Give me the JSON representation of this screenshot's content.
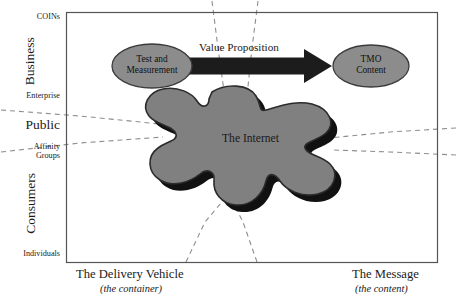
{
  "figure": {
    "type": "conceptual-diagram",
    "background_color": "#ffffff"
  },
  "axes": {
    "y_axis": {
      "name": "delivery-vehicle-axis",
      "labels_top_to_bottom": [
        {
          "text": "COINs",
          "size": "small",
          "orientation": "horizontal"
        },
        {
          "text": "Business",
          "size": "large",
          "orientation": "vertical"
        },
        {
          "text": "Enterprise",
          "size": "small",
          "orientation": "horizontal"
        },
        {
          "text": "Public",
          "size": "large",
          "orientation": "horizontal"
        },
        {
          "text": "Affinity",
          "size": "small",
          "orientation": "horizontal"
        },
        {
          "text": "Groups",
          "size": "small",
          "orientation": "horizontal"
        },
        {
          "text": "Consumers",
          "size": "large",
          "orientation": "vertical"
        },
        {
          "text": "Individuals",
          "size": "small",
          "orientation": "horizontal"
        }
      ]
    },
    "bottom_left": {
      "title": "The Delivery Vehicle",
      "subtitle": "(the container)"
    },
    "bottom_right": {
      "title": "The Message",
      "subtitle": "(the content)"
    }
  },
  "nodes": {
    "source_ellipse": {
      "line1": "Test and",
      "line2": "Measurement",
      "fill": "#8c8c8c",
      "stroke": "#3b3b3b"
    },
    "target_ellipse": {
      "line1": "TMO",
      "line2": "Content",
      "fill": "#8c8c8c",
      "stroke": "#3b3b3b"
    },
    "cloud": {
      "label": "The Internet",
      "fill": "#808080",
      "stroke": "#2b2b2b",
      "shadow": "#111111"
    }
  },
  "arrow": {
    "label": "Value Proposition",
    "color": "#1c1c1c",
    "direction": "left-to-right"
  },
  "frame": {
    "border_color": "#555555"
  },
  "dashed_lines": {
    "color": "#8e8e8e",
    "dash_pattern": "5 4",
    "count": 8
  }
}
